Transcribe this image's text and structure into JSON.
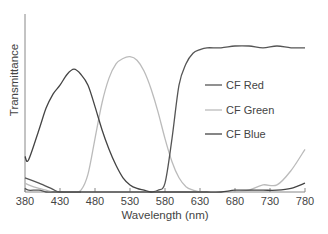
{
  "chart_data": {
    "type": "line",
    "title": "",
    "xlabel": "Wavelength (nm)",
    "ylabel": "Transmittance",
    "xlim": [
      380,
      780
    ],
    "ylim": [
      0,
      1
    ],
    "grid": false,
    "legend_position": "right-middle (inside plot)",
    "x_ticks": [
      380,
      430,
      480,
      530,
      580,
      630,
      680,
      730,
      780
    ],
    "y_ticks": [],
    "x": [
      380,
      385,
      400,
      410,
      420,
      430,
      440,
      450,
      460,
      470,
      480,
      490,
      500,
      510,
      520,
      530,
      540,
      550,
      560,
      570,
      580,
      590,
      600,
      610,
      620,
      630,
      640,
      660,
      680,
      700,
      720,
      740,
      760,
      780
    ],
    "series": [
      {
        "name": "CF Red",
        "color": "#555555",
        "values": [
          0.02,
          0.01,
          0.01,
          0.0,
          0.0,
          0.0,
          0.0,
          0.0,
          0.0,
          0.0,
          0.0,
          0.0,
          0.0,
          0.0,
          0.0,
          0.0,
          0.0,
          0.0,
          0.0,
          0.01,
          0.05,
          0.3,
          0.6,
          0.72,
          0.78,
          0.8,
          0.81,
          0.81,
          0.82,
          0.82,
          0.81,
          0.82,
          0.81,
          0.81
        ]
      },
      {
        "name": "CF Green",
        "color": "#bbbbbb",
        "values": [
          0.05,
          0.04,
          0.02,
          0.01,
          0.0,
          0.0,
          0.0,
          0.0,
          0.01,
          0.1,
          0.3,
          0.5,
          0.64,
          0.72,
          0.75,
          0.76,
          0.74,
          0.68,
          0.58,
          0.45,
          0.3,
          0.17,
          0.08,
          0.03,
          0.01,
          0.0,
          0.0,
          0.0,
          0.0,
          0.01,
          0.04,
          0.04,
          0.12,
          0.24
        ]
      },
      {
        "name": "CF Blue",
        "color": "#444444",
        "values": [
          0.2,
          0.18,
          0.35,
          0.47,
          0.55,
          0.6,
          0.66,
          0.69,
          0.66,
          0.6,
          0.48,
          0.35,
          0.24,
          0.15,
          0.08,
          0.04,
          0.02,
          0.01,
          0.0,
          0.0,
          0.0,
          0.0,
          0.0,
          0.0,
          0.0,
          0.0,
          0.0,
          0.0,
          0.01,
          0.01,
          0.01,
          0.01,
          0.02,
          0.05
        ]
      }
    ],
    "extra_lines_note": "A dark series also starts near 0.08 at 380 nm and falls to 0 by ~430 nm (CF Red short-wave tail)."
  },
  "legend": {
    "items": [
      {
        "label": "CF Red",
        "color": "#555555"
      },
      {
        "label": "CF Green",
        "color": "#bbbbbb"
      },
      {
        "label": "CF Blue",
        "color": "#444444"
      }
    ]
  },
  "axes": {
    "xlabel": "Wavelength (nm)",
    "ylabel": "Transmittance",
    "x_tick_labels": [
      "380",
      "430",
      "480",
      "530",
      "580",
      "630",
      "680",
      "730",
      "780"
    ]
  }
}
